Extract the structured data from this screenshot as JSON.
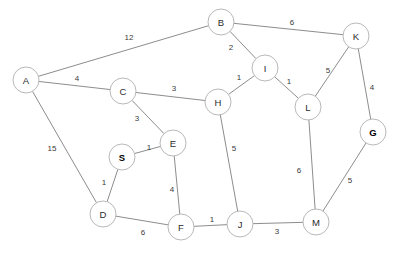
{
  "diagram": {
    "width": 396,
    "height": 253,
    "background_color": "#ffffff",
    "node_fill_color": "#ffffff",
    "node_stroke_color": "#b9b9b9",
    "edge_stroke_color": "#8d8d8d",
    "node_radius": 13,
    "nodes": [
      {
        "id": "A",
        "label": "A",
        "x": 26,
        "y": 80,
        "bold": false
      },
      {
        "id": "B",
        "label": "B",
        "x": 221,
        "y": 22,
        "bold": false
      },
      {
        "id": "C",
        "label": "C",
        "x": 123,
        "y": 91,
        "bold": false
      },
      {
        "id": "D",
        "label": "D",
        "x": 103,
        "y": 214,
        "bold": false
      },
      {
        "id": "E",
        "label": "E",
        "x": 173,
        "y": 143,
        "bold": false
      },
      {
        "id": "F",
        "label": "F",
        "x": 181,
        "y": 227,
        "bold": false
      },
      {
        "id": "G",
        "label": "G",
        "x": 373,
        "y": 132,
        "bold": true
      },
      {
        "id": "H",
        "label": "H",
        "x": 218,
        "y": 102,
        "bold": false
      },
      {
        "id": "I",
        "label": "I",
        "x": 265,
        "y": 68,
        "bold": false
      },
      {
        "id": "J",
        "label": "J",
        "x": 240,
        "y": 224,
        "bold": false
      },
      {
        "id": "K",
        "label": "K",
        "x": 356,
        "y": 36,
        "bold": false
      },
      {
        "id": "L",
        "label": "L",
        "x": 308,
        "y": 107,
        "bold": false
      },
      {
        "id": "M",
        "label": "M",
        "x": 316,
        "y": 222,
        "bold": false
      },
      {
        "id": "S",
        "label": "S",
        "x": 122,
        "y": 157,
        "bold": true
      }
    ],
    "edges": [
      {
        "source": "A",
        "target": "B",
        "weight": "12",
        "label_x": 129,
        "label_y": 37
      },
      {
        "source": "A",
        "target": "C",
        "weight": "4",
        "label_x": 77,
        "label_y": 78
      },
      {
        "source": "A",
        "target": "D",
        "weight": "15",
        "label_x": 52,
        "label_y": 148
      },
      {
        "source": "B",
        "target": "I",
        "weight": "2",
        "label_x": 231,
        "label_y": 47
      },
      {
        "source": "B",
        "target": "K",
        "weight": "6",
        "label_x": 292,
        "label_y": 22
      },
      {
        "source": "C",
        "target": "H",
        "weight": "3",
        "label_x": 174,
        "label_y": 88
      },
      {
        "source": "C",
        "target": "E",
        "weight": "3",
        "label_x": 137,
        "label_y": 118
      },
      {
        "source": "S",
        "target": "E",
        "weight": "1",
        "label_x": 149,
        "label_y": 147
      },
      {
        "source": "S",
        "target": "D",
        "weight": "1",
        "label_x": 104,
        "label_y": 182
      },
      {
        "source": "D",
        "target": "F",
        "weight": "6",
        "label_x": 143,
        "label_y": 232
      },
      {
        "source": "E",
        "target": "F",
        "weight": "4",
        "label_x": 172,
        "label_y": 189
      },
      {
        "source": "F",
        "target": "J",
        "weight": "1",
        "label_x": 212,
        "label_y": 219
      },
      {
        "source": "H",
        "target": "I",
        "weight": "1",
        "label_x": 239,
        "label_y": 77
      },
      {
        "source": "H",
        "target": "J",
        "weight": "5",
        "label_x": 234,
        "label_y": 148
      },
      {
        "source": "I",
        "target": "L",
        "weight": "1",
        "label_x": 289,
        "label_y": 81
      },
      {
        "source": "K",
        "target": "L",
        "weight": "5",
        "label_x": 328,
        "label_y": 70
      },
      {
        "source": "K",
        "target": "G",
        "weight": "4",
        "label_x": 372,
        "label_y": 87
      },
      {
        "source": "L",
        "target": "M",
        "weight": "6",
        "label_x": 299,
        "label_y": 170
      },
      {
        "source": "J",
        "target": "M",
        "weight": "3",
        "label_x": 277,
        "label_y": 231
      },
      {
        "source": "G",
        "target": "M",
        "weight": "5",
        "label_x": 350,
        "label_y": 180
      }
    ]
  }
}
